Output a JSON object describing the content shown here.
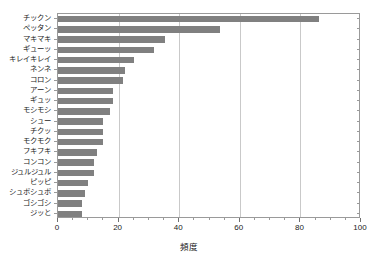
{
  "chart_data": {
    "type": "bar",
    "orientation": "horizontal",
    "title": "",
    "xlabel": "頻度",
    "ylabel": "",
    "xlim": [
      0,
      100
    ],
    "xticks": [
      0,
      20,
      40,
      60,
      80,
      100
    ],
    "xticklabels": [
      "0",
      "20",
      "40",
      "60",
      "80",
      "100"
    ],
    "grid": true,
    "grid_axis": "x",
    "legend": false,
    "bar_color": "#808080",
    "categories": [
      "チックン",
      "ペッタン",
      "マキマキ",
      "ギューッ",
      "キレイキレイ",
      "ネンネ",
      "コロン",
      "アーン",
      "ギュッ",
      "モシモシ",
      "シュー",
      "チクッ",
      "モクモク",
      "フキフキ",
      "コンコン",
      "ジュルジュル",
      "ピッピ",
      "シュポシュポ",
      "ゴシゴシ",
      "ジッと"
    ],
    "values": [
      86,
      53.5,
      35.3,
      31.7,
      25,
      22,
      21.5,
      18,
      18,
      17,
      15,
      15,
      15,
      13,
      12,
      12,
      10,
      9,
      8,
      8
    ]
  },
  "colors": {
    "bar": "#808080",
    "axis": "#9a9a9a",
    "grid": "#c9c9c9",
    "text": "#1a1a1a",
    "background": "#ffffff"
  }
}
